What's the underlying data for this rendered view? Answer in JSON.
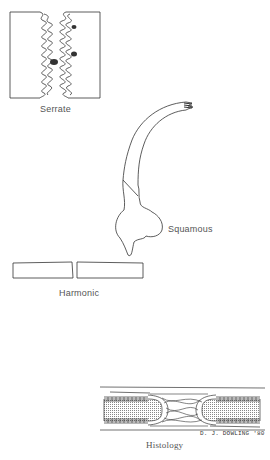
{
  "figures": [
    {
      "id": "serrate",
      "label": "Serrate",
      "description": "two rectangular bone ends with interlocking wavy (serrated) margins"
    },
    {
      "id": "squamous",
      "label": "Squamous",
      "description": "curved overlapping scale-like bone margin"
    },
    {
      "id": "harmonic",
      "label": "Harmonic",
      "description": "two rectangles with straight abutting edges"
    },
    {
      "id": "histology",
      "label": "Histology",
      "description": "cross-section of suture with periosteum layers and fibrous connective tissue"
    }
  ],
  "signature": "D. J. DOWLING '80",
  "colors": {
    "line": "#333333",
    "label": "#555555",
    "shade": "#bbbbbb",
    "background": "#ffffff"
  }
}
